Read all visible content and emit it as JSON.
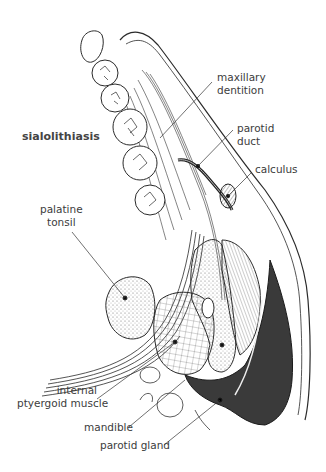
{
  "title": "sialolithiasis",
  "labels": {
    "maxillary_dentition": [
      "maxillary",
      "dentition"
    ],
    "parotid_duct": [
      "parotid",
      "duct"
    ],
    "calculus": "calculus",
    "palatine_tonsil": [
      "palatine",
      "tonsil"
    ],
    "internal_ptyergoid_muscle": [
      "internal",
      "ptyergoid muscle"
    ],
    "mandible": "mandible",
    "parotid_gland": "parotid gland"
  },
  "colors": {
    "line": "#2a2a2a",
    "gland_fill": "#3a3a3a",
    "text": "#3c3c3c"
  }
}
